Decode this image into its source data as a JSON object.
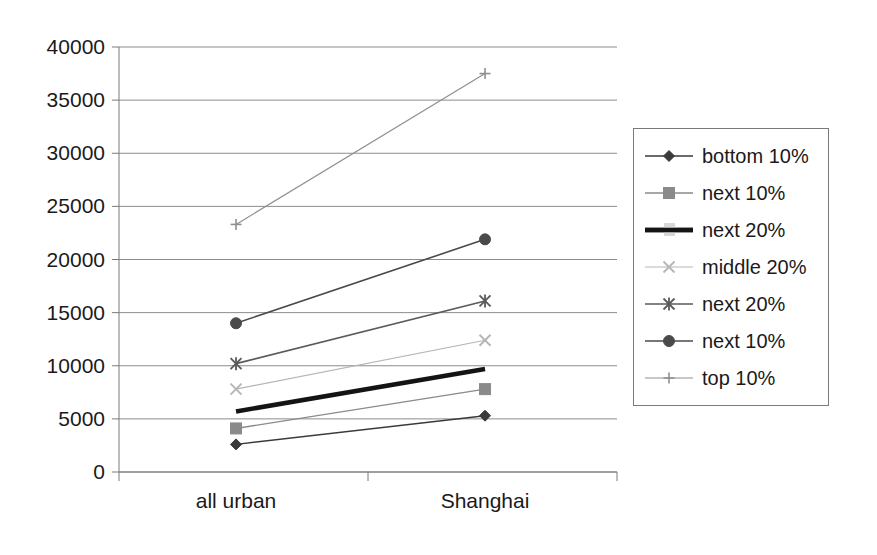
{
  "chart_data": {
    "type": "line",
    "title": "",
    "xlabel": "",
    "ylabel": "",
    "categories": [
      "all urban",
      "Shanghai"
    ],
    "x": [
      0,
      1
    ],
    "ylim": [
      0,
      40000
    ],
    "ytick_step": 5000,
    "yticks": [
      "0",
      "5000",
      "10000",
      "15000",
      "20000",
      "25000",
      "30000",
      "35000",
      "40000"
    ],
    "ytick_values": [
      0,
      5000,
      10000,
      15000,
      20000,
      25000,
      30000,
      35000,
      40000
    ],
    "grid": "horizontal",
    "legend_position": "right",
    "series": [
      {
        "name": "bottom 10%",
        "values": [
          2600,
          5300
        ],
        "marker": "diamond",
        "color": "#3a3a3a",
        "line_width": 1.4,
        "marker_size": 9
      },
      {
        "name": "next 10%",
        "values": [
          4100,
          7800
        ],
        "marker": "square",
        "color": "#8a8a8a",
        "line_width": 1.4,
        "marker_size": 11
      },
      {
        "name": "next 20%",
        "values": [
          5700,
          9700
        ],
        "marker": "none",
        "color": "#141414",
        "line_width": 4.5,
        "marker_size": 0
      },
      {
        "name": "middle 20%",
        "values": [
          7800,
          12400
        ],
        "marker": "x",
        "color": "#b5b5b5",
        "line_width": 1.2,
        "marker_size": 11
      },
      {
        "name": "next 20%",
        "values": [
          10200,
          16100
        ],
        "marker": "asterisk",
        "color": "#5a5a5a",
        "line_width": 1.6,
        "marker_size": 11
      },
      {
        "name": "next 10%",
        "values": [
          14000,
          21900
        ],
        "marker": "circle",
        "color": "#4a4a4a",
        "line_width": 1.6,
        "marker_size": 11
      },
      {
        "name": "top 10%",
        "values": [
          23300,
          37500
        ],
        "marker": "plus",
        "color": "#8f8f8f",
        "line_width": 1.2,
        "marker_size": 11
      }
    ]
  },
  "legend": {
    "items": [
      {
        "label": "bottom 10%"
      },
      {
        "label": "next 10%"
      },
      {
        "label": "next 20%"
      },
      {
        "label": "middle 20%"
      },
      {
        "label": "next 20%"
      },
      {
        "label": "next 10%"
      },
      {
        "label": "top 10%"
      }
    ]
  },
  "axes": {
    "x_labels": [
      "all urban",
      "Shanghai"
    ],
    "y_labels": [
      "40000",
      "35000",
      "30000",
      "25000",
      "20000",
      "15000",
      "10000",
      "5000",
      "0"
    ]
  },
  "colors": {
    "axis": "#7a7a7a",
    "grid": "#8c8c8c",
    "text": "#1a1a1a",
    "background": "#ffffff"
  }
}
